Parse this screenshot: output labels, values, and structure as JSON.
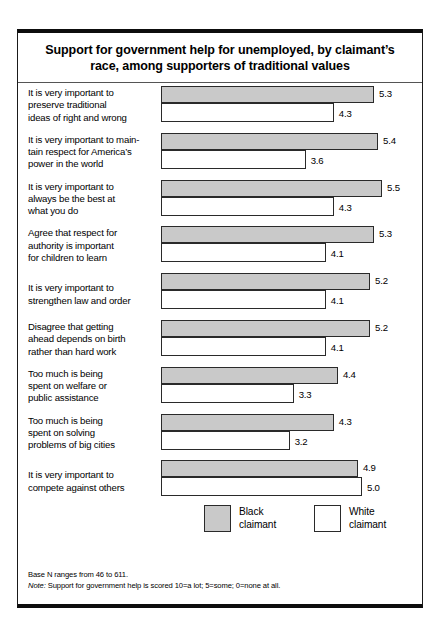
{
  "figure": {
    "title": "Support for government help for unemployed, by claimant’s race, among supporters of traditional values",
    "notes": {
      "base_n": "Base N ranges from 46 to 611.",
      "note_prefix": "Note:",
      "note_text": " Support for government help is scored 10=a lot; 5=some; 0=none at all."
    }
  },
  "legend": {
    "black": {
      "line1": "Black",
      "line2": "claimant",
      "color": "#c9c9c9"
    },
    "white": {
      "line1": "White",
      "line2": "claimant",
      "color": "#ffffff"
    }
  },
  "chart_data": {
    "type": "bar",
    "orientation": "horizontal",
    "title": "Support for government help for unemployed, by claimant’s race, among supporters of traditional values",
    "xlabel": "",
    "ylabel": "",
    "xlim": [
      0,
      5.6
    ],
    "grid": false,
    "legend_position": "bottom",
    "categories": [
      "It is very important to preserve traditional ideas of right and wrong",
      "It is very important to maintain respect for America’s power in the world",
      "It is very important to always be the best at what you do",
      "Agree that respect for authority is important for children to learn",
      "It is very important to strengthen law and order",
      "Disagree that getting ahead depends on birth rather than hard work",
      "Too much is being spent on welfare or public assistance",
      "Too much is being spent on solving problems of big cities",
      "It is very important to compete against others"
    ],
    "category_lines": [
      [
        "It is very important to",
        "preserve traditional",
        "ideas of right and wrong"
      ],
      [
        "It is very important to main-",
        "tain respect for America’s",
        "power in the world"
      ],
      [
        "It is very important to",
        "always be the best at",
        "what you do"
      ],
      [
        "Agree that respect for",
        "authority is important",
        "for children to learn"
      ],
      [
        "It is very important to",
        "strengthen law and order"
      ],
      [
        "Disagree that getting",
        "ahead depends on birth",
        "rather than hard work"
      ],
      [
        "Too much is being",
        "spent on welfare or",
        "public assistance"
      ],
      [
        "Too much is being",
        "spent on solving",
        "problems of big cities"
      ],
      [
        "It is very important to",
        "compete against others"
      ]
    ],
    "series": [
      {
        "name": "Black claimant",
        "color": "#c9c9c9",
        "values": [
          5.3,
          5.4,
          5.5,
          5.3,
          5.2,
          5.2,
          4.4,
          4.3,
          4.9
        ],
        "labels": [
          "5.3",
          "5.4",
          "5.5",
          "5.3",
          "5.2",
          "5.2",
          "4.4",
          "4.3",
          "4.9"
        ]
      },
      {
        "name": "White claimant",
        "color": "#ffffff",
        "values": [
          4.3,
          3.6,
          4.3,
          4.1,
          4.1,
          4.1,
          3.3,
          3.2,
          5.0
        ],
        "labels": [
          "4.3",
          "3.6",
          "4.3",
          "4.1",
          "4.1",
          "4.1",
          "3.3",
          "3.2",
          "5.0"
        ]
      }
    ]
  }
}
